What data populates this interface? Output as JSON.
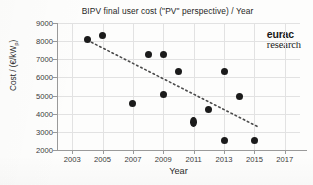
{
  "chart_data": {
    "type": "scatter",
    "title": "BIPV final user cost (\"PV\" perspective) / Year",
    "xlabel": "Year",
    "ylabel": "Cost / (€/kWp)",
    "ylabel_main": "Cost / (€/kW",
    "ylabel_sub": "p",
    "ylabel_close": ")",
    "xlim": [
      2002,
      2018
    ],
    "ylim": [
      2000,
      9000
    ],
    "grid": true,
    "legend": "none",
    "x_ticks": [
      "2003",
      "2005",
      "2007",
      "2009",
      "2011",
      "2013",
      "2015",
      "2017"
    ],
    "x_tick_values": [
      2003,
      2005,
      2007,
      2009,
      2011,
      2013,
      2015,
      2017
    ],
    "y_ticks": [
      "2000",
      "3000",
      "4000",
      "5000",
      "6000",
      "7000",
      "8000",
      "9000"
    ],
    "y_tick_values": [
      2000,
      3000,
      4000,
      5000,
      6000,
      7000,
      8000,
      9000
    ],
    "series": [
      {
        "name": "BIPV final user cost",
        "marker": "filled-circle",
        "color": "#1b1b1b",
        "points": [
          {
            "x": 2004,
            "y": 8100,
            "shape": "circle"
          },
          {
            "x": 2005,
            "y": 8300,
            "shape": "circle"
          },
          {
            "x": 2007,
            "y": 4580,
            "shape": "circle"
          },
          {
            "x": 2008,
            "y": 7250,
            "shape": "circle"
          },
          {
            "x": 2009,
            "y": 7250,
            "shape": "circle"
          },
          {
            "x": 2009,
            "y": 5080,
            "shape": "circle"
          },
          {
            "x": 2010,
            "y": 6300,
            "shape": "circle"
          },
          {
            "x": 2011,
            "y": 3570,
            "shape": "tall"
          },
          {
            "x": 2012,
            "y": 4250,
            "shape": "circle"
          },
          {
            "x": 2013,
            "y": 6350,
            "shape": "circle"
          },
          {
            "x": 2013,
            "y": 2530,
            "shape": "circle"
          },
          {
            "x": 2014,
            "y": 4930,
            "shape": "circle"
          },
          {
            "x": 2015,
            "y": 2520,
            "shape": "circle"
          }
        ]
      }
    ],
    "trendline": {
      "style": "dotted",
      "color": "#4a4a4a",
      "x_start": 2004.0,
      "y_start": 8050,
      "x_end": 2015.3,
      "y_end": 3250
    }
  },
  "branding": {
    "logo_top": "eurac",
    "logo_bottom": "research"
  }
}
